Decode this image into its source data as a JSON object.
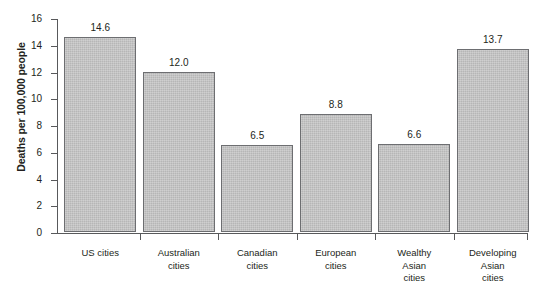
{
  "chart_data": {
    "type": "bar",
    "title": "",
    "subtitle": "",
    "xlabel": "",
    "ylabel": "Deaths per 100,000 people",
    "ylim": [
      0,
      16
    ],
    "ytick_values": [
      16,
      14,
      12,
      10,
      8,
      6,
      4,
      2,
      0
    ],
    "ytick_labels": [
      "16",
      "14",
      "12",
      "10",
      "8",
      "6",
      "4",
      "2",
      "0"
    ],
    "grid": false,
    "legend": false,
    "legend_position": "none",
    "bar_fill_color": "#bdbdbd",
    "bar_border_color": "#6d6e71",
    "axis_color": "#58595b",
    "text_color": "#231f20",
    "background_color": "#ffffff",
    "categories": [
      "US cities",
      "Australian\ncities",
      "Canadian\ncities",
      "European\ncities",
      "Wealthy\nAsian\ncities",
      "Developing\nAsian\ncities"
    ],
    "values": [
      14.6,
      12.0,
      6.5,
      8.8,
      6.6,
      13.7
    ],
    "value_labels": [
      "14.6",
      "12.0",
      "6.5",
      "8.8",
      "6.6",
      "13.7"
    ]
  }
}
